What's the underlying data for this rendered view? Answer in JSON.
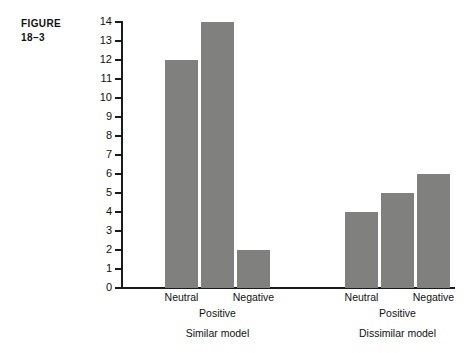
{
  "figure": {
    "label_line1": "FIGURE",
    "label_line2": "18–3"
  },
  "chart_data": {
    "type": "bar",
    "title": "",
    "xlabel": "",
    "ylabel": "",
    "ylim": [
      0,
      14
    ],
    "ytick_step": 1,
    "grid": false,
    "legend": "none",
    "bar_color": "#80807f",
    "axis_color": "#1a1a1a",
    "yticks": [
      "0",
      "1",
      "2",
      "3",
      "4",
      "5",
      "6",
      "7",
      "8",
      "9",
      "10",
      "11",
      "12",
      "13",
      "14"
    ],
    "categories": [
      "Neutral",
      "Positive",
      "Negative"
    ],
    "groups": [
      {
        "name": "Similar model",
        "categories": [
          "Neutral",
          "Positive",
          "Negative"
        ],
        "values": [
          12,
          14,
          2
        ]
      },
      {
        "name": "Dissimilar model",
        "categories": [
          "Neutral",
          "Positive",
          "Negative"
        ],
        "values": [
          4,
          5,
          6
        ]
      }
    ],
    "series": [
      {
        "name": "Similar model",
        "values": [
          12,
          14,
          2
        ]
      },
      {
        "name": "Dissimilar model",
        "values": [
          4,
          5,
          6
        ]
      }
    ]
  }
}
